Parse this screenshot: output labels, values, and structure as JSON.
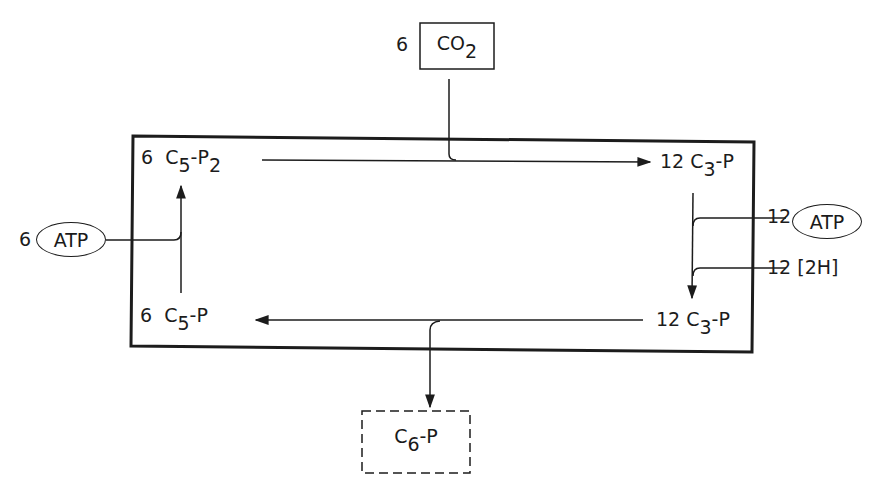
{
  "diagram": {
    "input": {
      "coefficient": "6",
      "species": "CO",
      "subscript": "2"
    },
    "output": {
      "species": "C",
      "subscript": "6",
      "suffix": "-P",
      "style": "dashed"
    },
    "nodes": {
      "top_left": {
        "coefficient": "6",
        "species": "C",
        "subscript": "5",
        "suffix": "-P",
        "suffix_subscript": "2"
      },
      "top_right": {
        "coefficient": "12",
        "species": "C",
        "subscript": "3",
        "suffix": "-P"
      },
      "bottom_right": {
        "coefficient": "12",
        "species": "C",
        "subscript": "3",
        "suffix": "-P"
      },
      "bottom_left": {
        "coefficient": "6",
        "species": "C",
        "subscript": "5",
        "suffix": "-P"
      }
    },
    "cofactors": {
      "left_atp": {
        "coefficient": "6",
        "label": "ATP"
      },
      "right_atp": {
        "coefficient": "12",
        "label": "ATP"
      },
      "right_2h": {
        "coefficient": "12",
        "label": "[2H]"
      }
    }
  }
}
